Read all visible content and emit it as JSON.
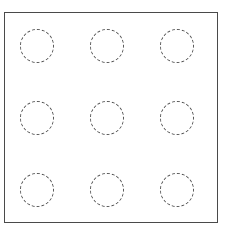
{
  "diagram": {
    "frame": {
      "x": 4,
      "y": 12,
      "width": 214,
      "height": 211,
      "stroke": "#4a4a4a"
    },
    "grid": {
      "rows": 3,
      "cols": 3
    },
    "circle_style": {
      "radius": 17,
      "stroke": "#555555",
      "dash": "dashed"
    },
    "circles": [
      {
        "row": 1,
        "col": 1,
        "cx": 37,
        "cy": 46
      },
      {
        "row": 1,
        "col": 2,
        "cx": 107,
        "cy": 46
      },
      {
        "row": 1,
        "col": 3,
        "cx": 177,
        "cy": 46
      },
      {
        "row": 2,
        "col": 1,
        "cx": 37,
        "cy": 118
      },
      {
        "row": 2,
        "col": 2,
        "cx": 107,
        "cy": 118
      },
      {
        "row": 2,
        "col": 3,
        "cx": 177,
        "cy": 118
      },
      {
        "row": 3,
        "col": 1,
        "cx": 37,
        "cy": 190
      },
      {
        "row": 3,
        "col": 2,
        "cx": 107,
        "cy": 190
      },
      {
        "row": 3,
        "col": 3,
        "cx": 177,
        "cy": 190
      }
    ]
  }
}
